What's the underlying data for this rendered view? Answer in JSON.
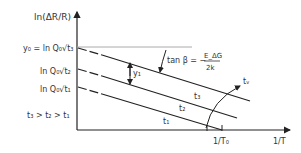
{
  "diagram": {
    "y_axis_label": "ln(ΔR/R)",
    "x_axis_label": "1/T",
    "x_marker_label": "1/T₀",
    "y_labels": [
      {
        "text": "y₀ = ln Q₀√t₃"
      },
      {
        "text": "ln Q₀√t₂"
      },
      {
        "text": "ln Q₀√t₁"
      }
    ],
    "inequality": "t₃ > t₂ > t₁",
    "slope_label": "tan β = −",
    "slope_numerator": "E_ΔG",
    "slope_denominator": "2k",
    "offset_label": "y₁",
    "arrow_label": "tᵥ",
    "lines": [
      {
        "label": "t₃"
      },
      {
        "label": "t₂"
      },
      {
        "label": "t₁"
      }
    ],
    "colors": {
      "line": "#222222",
      "reference": "#aaaaaa"
    }
  }
}
